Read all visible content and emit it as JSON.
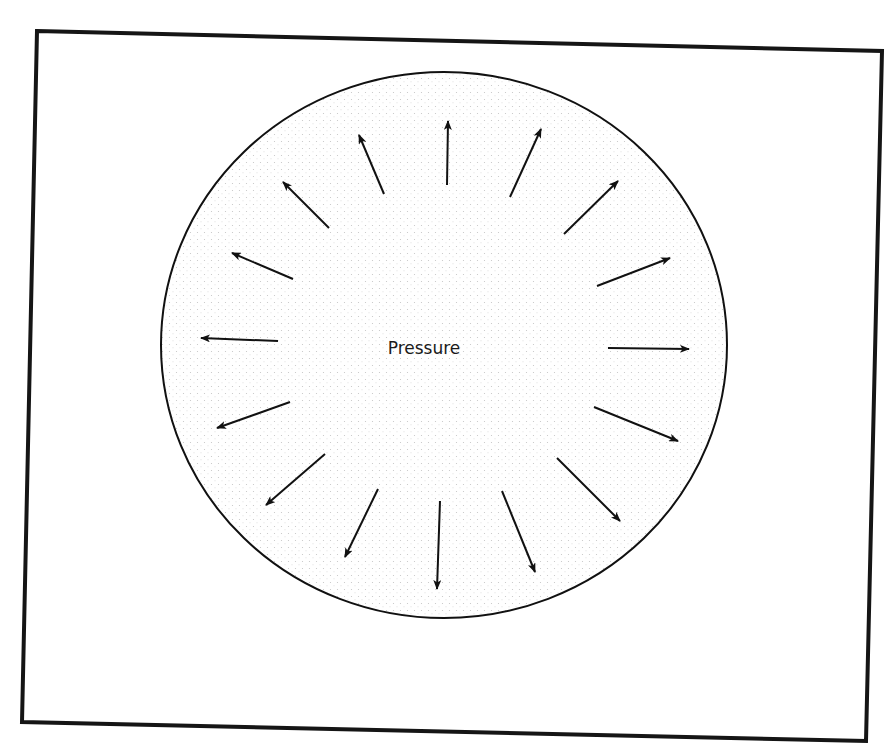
{
  "diagram": {
    "center_label": "Pressure",
    "colors": {
      "ink": "#111111",
      "frame": "#151515",
      "stipple": "#c8c8c8",
      "background": "#ffffff"
    },
    "frame": {
      "corners": [
        [
          37,
          31
        ],
        [
          882,
          51
        ],
        [
          866,
          741
        ],
        [
          22,
          722
        ]
      ],
      "stroke_width": 4
    },
    "circle": {
      "cx": 444,
      "cy": 345,
      "rx": 283,
      "ry": 273,
      "stroke_width": 2,
      "fill": "stipple"
    },
    "label_position": {
      "x": 424,
      "y": 354
    },
    "arrows": [
      {
        "id": "n",
        "from": [
          447,
          185
        ],
        "to": [
          448,
          121
        ]
      },
      {
        "id": "nne",
        "from": [
          510,
          197
        ],
        "to": [
          541,
          129
        ]
      },
      {
        "id": "ne",
        "from": [
          564,
          234
        ],
        "to": [
          618,
          181
        ]
      },
      {
        "id": "ene",
        "from": [
          597,
          286
        ],
        "to": [
          670,
          258
        ]
      },
      {
        "id": "e",
        "from": [
          608,
          348
        ],
        "to": [
          689,
          349
        ]
      },
      {
        "id": "ese",
        "from": [
          594,
          407
        ],
        "to": [
          678,
          441
        ]
      },
      {
        "id": "se",
        "from": [
          557,
          458
        ],
        "to": [
          620,
          521
        ]
      },
      {
        "id": "sse",
        "from": [
          502,
          491
        ],
        "to": [
          535,
          572
        ]
      },
      {
        "id": "s",
        "from": [
          440,
          501
        ],
        "to": [
          437,
          589
        ]
      },
      {
        "id": "ssw",
        "from": [
          378,
          489
        ],
        "to": [
          345,
          557
        ]
      },
      {
        "id": "sw",
        "from": [
          325,
          454
        ],
        "to": [
          266,
          505
        ]
      },
      {
        "id": "wsw",
        "from": [
          290,
          402
        ],
        "to": [
          217,
          428
        ]
      },
      {
        "id": "w",
        "from": [
          278,
          341
        ],
        "to": [
          201,
          338
        ]
      },
      {
        "id": "wnw",
        "from": [
          293,
          279
        ],
        "to": [
          232,
          253
        ]
      },
      {
        "id": "nw",
        "from": [
          329,
          228
        ],
        "to": [
          283,
          182
        ]
      },
      {
        "id": "nnw",
        "from": [
          384,
          194
        ],
        "to": [
          359,
          135
        ]
      }
    ]
  }
}
